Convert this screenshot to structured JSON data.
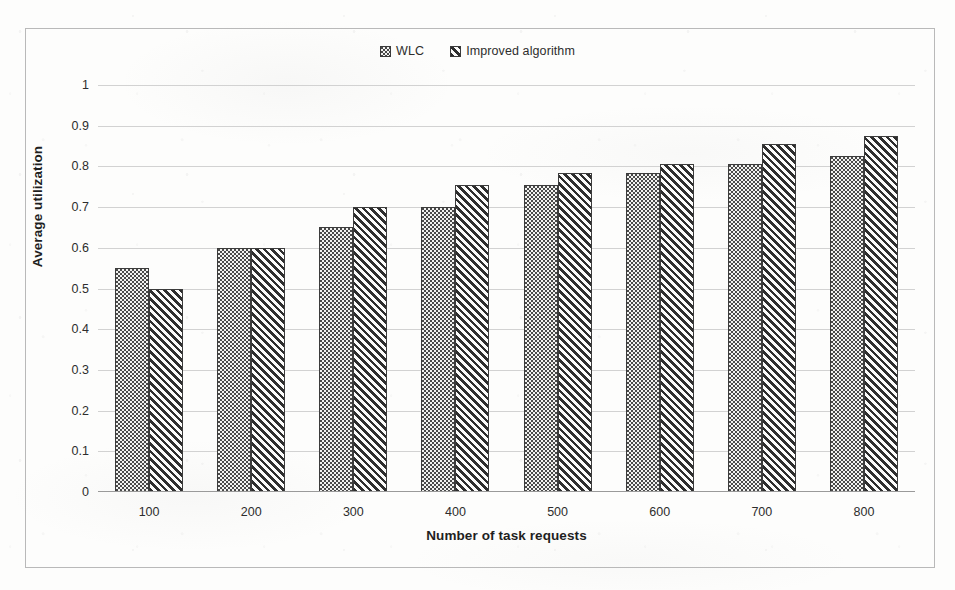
{
  "chart_data": {
    "type": "bar",
    "title": "",
    "xlabel": "Number of task requests",
    "ylabel": "Average utilization",
    "categories": [
      "100",
      "200",
      "300",
      "400",
      "500",
      "600",
      "700",
      "800"
    ],
    "series": [
      {
        "name": "WLC",
        "pattern": "dots",
        "values": [
          0.55,
          0.6,
          0.65,
          0.7,
          0.755,
          0.785,
          0.805,
          0.825
        ]
      },
      {
        "name": "Improved algorithm",
        "pattern": "diagonal-hatch",
        "values": [
          0.5,
          0.6,
          0.7,
          0.755,
          0.785,
          0.805,
          0.855,
          0.875
        ]
      }
    ],
    "ylim": [
      0,
      1
    ],
    "ytick_labels": [
      "1",
      "0.9",
      "0.8",
      "0.7",
      "0.6",
      "0.5",
      "0.4",
      "0.3",
      "0.2",
      "0.1",
      "0"
    ],
    "ytick_values": [
      1,
      0.9,
      0.8,
      0.7,
      0.6,
      0.5,
      0.4,
      0.3,
      0.2,
      0.1,
      0
    ],
    "grid": true,
    "legend_position": "top-center",
    "colors": {
      "bar_outline": "#3c3c3c",
      "gridline": "#d2d2d2",
      "axis": "#9a9a9a",
      "text": "#2d2d2d",
      "frame": "#b9b9b9",
      "background": "#fdfdfc"
    }
  }
}
